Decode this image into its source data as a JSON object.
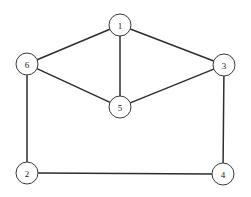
{
  "diagram": {
    "type": "node-link-graph",
    "width": 251,
    "height": 197,
    "background_color": "#ffffff",
    "style": {
      "edge_color": "#2e2e2e",
      "edge_width": 1.5,
      "node_fill": "#ffffff",
      "node_stroke": "#3a3a3a",
      "node_stroke_width": 1,
      "node_radius": 11,
      "label_color": "#1a1a1a",
      "label_font_size": 9
    },
    "nodes": [
      {
        "id": "1",
        "label": "1",
        "x": 120,
        "y": 25
      },
      {
        "id": "2",
        "label": "2",
        "x": 27,
        "y": 173
      },
      {
        "id": "3",
        "label": "3",
        "x": 224,
        "y": 65
      },
      {
        "id": "4",
        "label": "4",
        "x": 223,
        "y": 174
      },
      {
        "id": "5",
        "label": "5",
        "x": 120,
        "y": 107
      },
      {
        "id": "6",
        "label": "6",
        "x": 27,
        "y": 64
      }
    ],
    "edges": [
      {
        "id": "edge-1-6",
        "source": "1",
        "target": "6"
      },
      {
        "id": "edge-1-3",
        "source": "1",
        "target": "3"
      },
      {
        "id": "edge-1-5",
        "source": "1",
        "target": "5"
      },
      {
        "id": "edge-6-5",
        "source": "6",
        "target": "5"
      },
      {
        "id": "edge-5-3",
        "source": "5",
        "target": "3"
      },
      {
        "id": "edge-6-2",
        "source": "6",
        "target": "2"
      },
      {
        "id": "edge-3-4",
        "source": "3",
        "target": "4"
      },
      {
        "id": "edge-2-4",
        "source": "2",
        "target": "4"
      }
    ]
  }
}
